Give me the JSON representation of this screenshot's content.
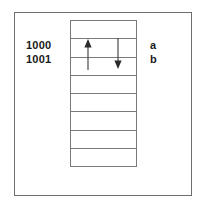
{
  "figure": {
    "kind": "memory-cell-diagram",
    "width": 201,
    "height": 208,
    "background_color": "#ffffff",
    "frame_border_color": "#6e6e6e",
    "table_border_color": "#7a7a7a",
    "text_color": "#1a1a1a",
    "arrow_color": "#3a3a3a"
  },
  "memory_table": {
    "row_count": 8,
    "rows": [
      {
        "index": 0,
        "address": "",
        "variable": ""
      },
      {
        "index": 1,
        "address": "1000",
        "variable": "a"
      },
      {
        "index": 2,
        "address": "1001",
        "variable": "b"
      },
      {
        "index": 3,
        "address": "",
        "variable": ""
      },
      {
        "index": 4,
        "address": "",
        "variable": ""
      },
      {
        "index": 5,
        "address": "",
        "variable": ""
      },
      {
        "index": 6,
        "address": "",
        "variable": ""
      },
      {
        "index": 7,
        "address": "",
        "variable": ""
      }
    ]
  },
  "address_labels": [
    {
      "text": "1000"
    },
    {
      "text": "1001"
    }
  ],
  "variable_labels": [
    {
      "text": "a"
    },
    {
      "text": "b"
    }
  ],
  "arrows": [
    {
      "name": "up-arrow",
      "direction": "up",
      "from_row": 2,
      "to_row": 1,
      "x": 88,
      "tail_y": 70,
      "head_y": 41
    },
    {
      "name": "down-arrow",
      "direction": "down",
      "from_row": 1,
      "to_row": 2,
      "x": 118,
      "tail_y": 38,
      "head_y": 68
    }
  ]
}
